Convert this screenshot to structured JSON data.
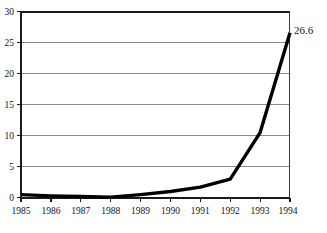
{
  "chart_data": {
    "type": "line",
    "title": "",
    "subtitle": "",
    "xlabel": "",
    "ylabel": "",
    "categories": [
      "1985",
      "1986",
      "1987",
      "1988",
      "1989",
      "1990",
      "1991",
      "1992",
      "1993",
      "1994"
    ],
    "x": [
      1985,
      1986,
      1987,
      1988,
      1989,
      1990,
      1991,
      1992,
      1993,
      1994
    ],
    "values": [
      0.5,
      0.3,
      0.2,
      0.1,
      0.5,
      1.0,
      1.7,
      3.0,
      10.5,
      26.6
    ],
    "series": [
      {
        "name": "",
        "values": [
          0.5,
          0.3,
          0.2,
          0.1,
          0.5,
          1.0,
          1.7,
          3.0,
          10.5,
          26.6
        ]
      }
    ],
    "ylim": [
      0,
      30
    ],
    "xlim": [
      1985,
      1994
    ],
    "yticks": [
      0,
      5,
      10,
      15,
      20,
      25,
      30
    ],
    "ytick_labels": [
      "0",
      "5",
      "10",
      "15",
      "20",
      "25",
      "30"
    ],
    "xtick_labels": [
      "1985",
      "1986",
      "1987",
      "1988",
      "1989",
      "1990",
      "1991",
      "1992",
      "1993",
      "1994"
    ],
    "grid": true,
    "grid_axis": "y",
    "legend": false,
    "legend_position": "none",
    "annotations": [
      {
        "text": "26.6",
        "x": 1994,
        "y": 26.6,
        "position": "right"
      }
    ],
    "colors": {
      "line": "#000000",
      "grid": "#8a8a8a",
      "axis": "#1a1a1a",
      "background": "#ffffff",
      "text": "#111111"
    }
  },
  "labels": {
    "y0": "0",
    "y5": "5",
    "y10": "10",
    "y15": "15",
    "y20": "20",
    "y25": "25",
    "y30": "30",
    "x1985": "1985",
    "x1986": "1986",
    "x1987": "1987",
    "x1988": "1988",
    "x1989": "1989",
    "x1990": "1990",
    "x1991": "1991",
    "x1992": "1992",
    "x1993": "1993",
    "x1994": "1994",
    "endpoint": "26.6"
  }
}
